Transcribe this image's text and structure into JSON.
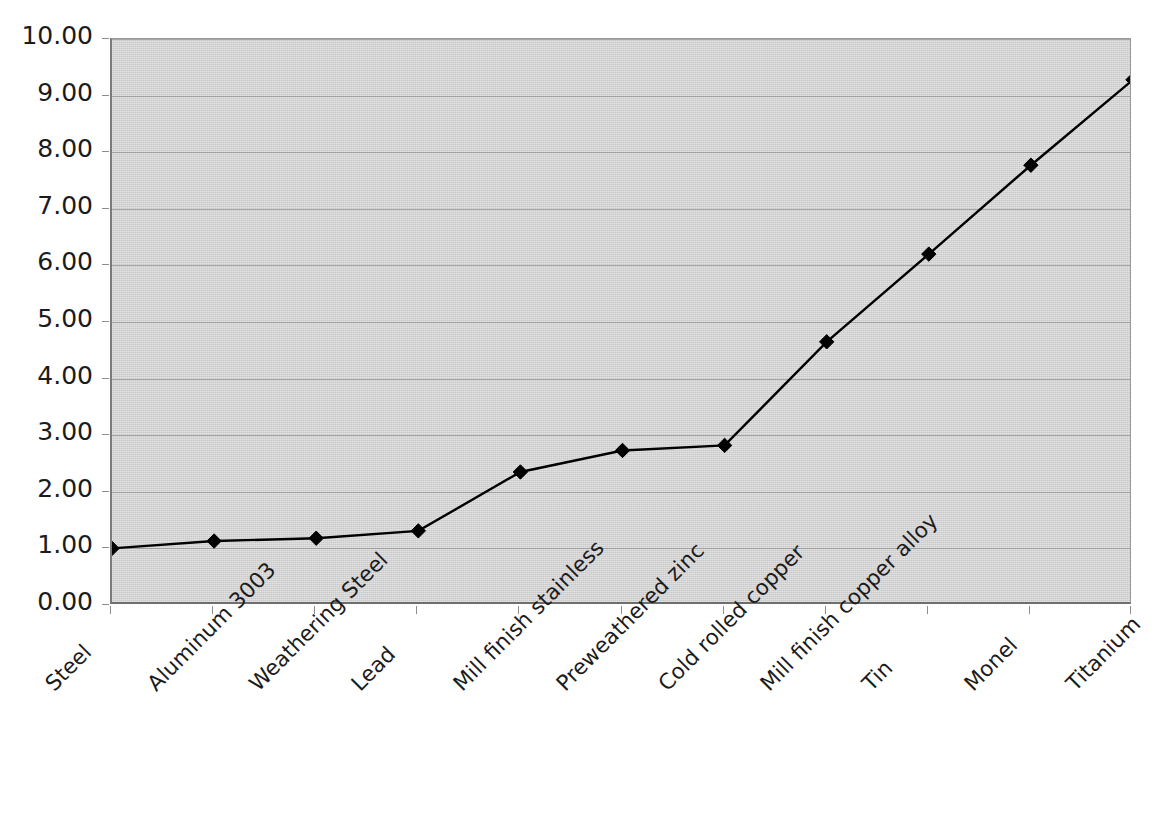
{
  "chart_data": {
    "type": "line",
    "title": "",
    "subtitle": "",
    "xlabel": "",
    "ylabel": "",
    "ylim": [
      0,
      10
    ],
    "ytick_labels": [
      "10.00",
      "9.00",
      "8.00",
      "7.00",
      "6.00",
      "5.00",
      "4.00",
      "3.00",
      "2.00",
      "1.00",
      "0.00"
    ],
    "ytick_values": [
      10,
      9,
      8,
      7,
      6,
      5,
      4,
      3,
      2,
      1,
      0
    ],
    "grid": true,
    "grid_axis": "y",
    "legend": false,
    "legend_position": "none",
    "marker": "diamond",
    "line_color": "#000000",
    "marker_color": "#000000",
    "plot_background": "#c9c9c9",
    "page_background": "#ffffff",
    "categories": [
      "Steel",
      "Aluminum 3003",
      "Weathering Steel",
      "Lead",
      "Mill finish stainless",
      "Preweathered zinc",
      "Cold rolled copper",
      "Mill finish copper alloy",
      "Tin",
      "Monel",
      "Titanium"
    ],
    "values": [
      1.0,
      1.13,
      1.18,
      1.31,
      2.35,
      2.73,
      2.82,
      4.65,
      6.2,
      7.77,
      9.28
    ],
    "series": [
      {
        "name": "Relative cost",
        "values": [
          1.0,
          1.13,
          1.18,
          1.31,
          2.35,
          2.73,
          2.82,
          4.65,
          6.2,
          7.77,
          9.28
        ]
      }
    ]
  }
}
